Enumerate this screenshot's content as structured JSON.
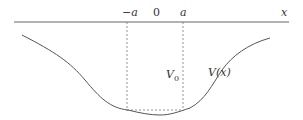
{
  "diagram": {
    "axis": {
      "label": "x"
    },
    "ticks": [
      {
        "label": "−a"
      },
      {
        "label": "0"
      },
      {
        "label": "a"
      }
    ],
    "labels": {
      "well_depth": "V",
      "well_depth_subscript": "0",
      "curve": "V(x)"
    },
    "colors": {
      "line": "#666666",
      "curve": "#555555",
      "dashed": "#777777",
      "text": "#333333"
    }
  }
}
